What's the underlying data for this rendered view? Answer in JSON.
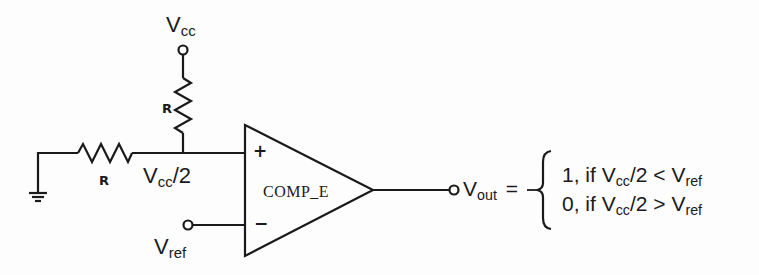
{
  "diagram": {
    "type": "comparator circuit",
    "supply": {
      "label": "V",
      "sub": "cc"
    },
    "top_resistor": {
      "label": "R"
    },
    "bottom_resistor": {
      "label": "R"
    },
    "midpoint": {
      "label": "V",
      "sub": "cc",
      "suffix": "/2"
    },
    "reference": {
      "label": "V",
      "sub": "ref"
    },
    "comparator": {
      "name": "COMP_E",
      "plus": "+",
      "minus": "−"
    },
    "output": {
      "label": "V",
      "sub": "out",
      "equals": "=",
      "cases": [
        {
          "value": "1, if V",
          "sub1": "cc",
          "mid": "/2 < V",
          "sub2": "ref"
        },
        {
          "value": "0, if V",
          "sub1": "cc",
          "mid": "/2 > V",
          "sub2": "ref"
        }
      ]
    },
    "colors": {
      "ink": "#1a1a1a",
      "background": "#fdfdfd"
    }
  }
}
